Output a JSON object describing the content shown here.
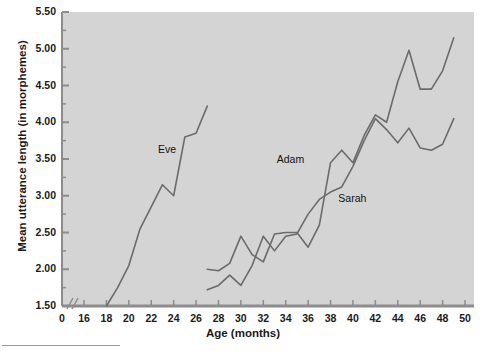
{
  "figure": {
    "plot_bg": "#d4d4d4",
    "line_color": "#6b6b6b",
    "axis_color": "#8c8c8c",
    "text_color": "#1a1a1a"
  },
  "axes": {
    "y_title": "Mean utterance length (in morphemes)",
    "x_title": "Age (months)",
    "y_ticks": [
      "1.50",
      "2.00",
      "2.50",
      "3.00",
      "3.50",
      "4.00",
      "4.50",
      "5.00",
      "5.50"
    ],
    "x_ticks": [
      "0",
      "16",
      "18",
      "20",
      "22",
      "24",
      "26",
      "28",
      "30",
      "32",
      "34",
      "36",
      "38",
      "40",
      "42",
      "44",
      "46",
      "48",
      "50"
    ],
    "axis_break": "//"
  },
  "series_labels": {
    "eve": "Eve",
    "adam": "Adam",
    "sarah": "Sarah"
  },
  "chart_data": {
    "type": "line",
    "title": "",
    "xlabel": "Age (months)",
    "ylabel": "Mean utterance length (in morphemes)",
    "xlim": [
      16,
      50
    ],
    "ylim": [
      1.5,
      5.5
    ],
    "x_tick_values": [
      16,
      18,
      20,
      22,
      24,
      26,
      28,
      30,
      32,
      34,
      36,
      38,
      40,
      42,
      44,
      46,
      48,
      50
    ],
    "y_tick_values": [
      1.5,
      2.0,
      2.5,
      3.0,
      3.5,
      4.0,
      4.5,
      5.0,
      5.5
    ],
    "grid": false,
    "legend": "inline-labels",
    "axis_break_after": 0,
    "series": [
      {
        "name": "Eve",
        "label_position": {
          "x": 22.6,
          "y": 3.62
        },
        "points": [
          {
            "x": 18.0,
            "y": 1.5
          },
          {
            "x": 19.0,
            "y": 1.75
          },
          {
            "x": 20.0,
            "y": 2.05
          },
          {
            "x": 21.0,
            "y": 2.55
          },
          {
            "x": 22.0,
            "y": 2.85
          },
          {
            "x": 23.0,
            "y": 3.15
          },
          {
            "x": 24.0,
            "y": 3.0
          },
          {
            "x": 25.0,
            "y": 3.8
          },
          {
            "x": 26.0,
            "y": 3.85
          },
          {
            "x": 27.0,
            "y": 4.22
          }
        ]
      },
      {
        "name": "Adam",
        "label_position": {
          "x": 33.2,
          "y": 3.48
        },
        "points": [
          {
            "x": 27.0,
            "y": 2.0
          },
          {
            "x": 28.0,
            "y": 1.98
          },
          {
            "x": 29.0,
            "y": 2.08
          },
          {
            "x": 30.0,
            "y": 2.45
          },
          {
            "x": 31.0,
            "y": 2.2
          },
          {
            "x": 32.0,
            "y": 2.1
          },
          {
            "x": 33.0,
            "y": 2.48
          },
          {
            "x": 34.0,
            "y": 2.5
          },
          {
            "x": 35.0,
            "y": 2.5
          },
          {
            "x": 36.0,
            "y": 2.3
          },
          {
            "x": 37.0,
            "y": 2.6
          },
          {
            "x": 38.0,
            "y": 3.45
          },
          {
            "x": 39.0,
            "y": 3.62
          },
          {
            "x": 40.0,
            "y": 3.45
          },
          {
            "x": 41.0,
            "y": 3.82
          },
          {
            "x": 42.0,
            "y": 4.1
          },
          {
            "x": 43.0,
            "y": 4.0
          },
          {
            "x": 44.0,
            "y": 4.55
          },
          {
            "x": 45.0,
            "y": 4.98
          },
          {
            "x": 46.0,
            "y": 4.45
          },
          {
            "x": 47.0,
            "y": 4.45
          },
          {
            "x": 48.0,
            "y": 4.7
          },
          {
            "x": 49.0,
            "y": 5.15
          }
        ]
      },
      {
        "name": "Sarah",
        "label_position": {
          "x": 38.7,
          "y": 2.95
        },
        "points": [
          {
            "x": 27.0,
            "y": 1.72
          },
          {
            "x": 28.0,
            "y": 1.78
          },
          {
            "x": 29.0,
            "y": 1.92
          },
          {
            "x": 30.0,
            "y": 1.78
          },
          {
            "x": 31.0,
            "y": 2.05
          },
          {
            "x": 32.0,
            "y": 2.45
          },
          {
            "x": 33.0,
            "y": 2.25
          },
          {
            "x": 34.0,
            "y": 2.45
          },
          {
            "x": 35.0,
            "y": 2.48
          },
          {
            "x": 36.0,
            "y": 2.75
          },
          {
            "x": 37.0,
            "y": 2.95
          },
          {
            "x": 38.0,
            "y": 3.05
          },
          {
            "x": 39.0,
            "y": 3.12
          },
          {
            "x": 40.0,
            "y": 3.4
          },
          {
            "x": 41.0,
            "y": 3.75
          },
          {
            "x": 42.0,
            "y": 4.05
          },
          {
            "x": 43.0,
            "y": 3.9
          },
          {
            "x": 44.0,
            "y": 3.72
          },
          {
            "x": 45.0,
            "y": 3.92
          },
          {
            "x": 46.0,
            "y": 3.65
          },
          {
            "x": 47.0,
            "y": 3.62
          },
          {
            "x": 48.0,
            "y": 3.7
          },
          {
            "x": 49.0,
            "y": 4.05
          }
        ]
      }
    ]
  }
}
